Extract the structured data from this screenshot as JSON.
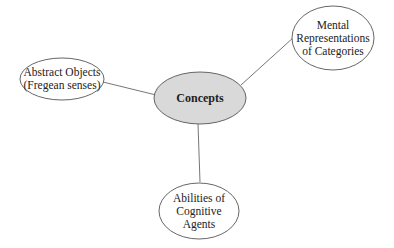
{
  "colors": {
    "stroke": "#555555",
    "center_fill": "#d9d9d9",
    "node_fill": "#ffffff",
    "text": "#222222"
  },
  "diagram": {
    "type": "mind-map",
    "center": {
      "label": "Concepts"
    },
    "nodes": [
      {
        "id": "abstract",
        "lines": [
          "Abstract Objects",
          "(Fregean senses)"
        ]
      },
      {
        "id": "mental",
        "lines": [
          "Mental",
          "Representations",
          "of Categories"
        ]
      },
      {
        "id": "abilities",
        "lines": [
          "Abilities of",
          "Cognitive Agents"
        ]
      }
    ],
    "edges": [
      {
        "from": "Concepts",
        "to": "abstract"
      },
      {
        "from": "Concepts",
        "to": "mental"
      },
      {
        "from": "Concepts",
        "to": "abilities"
      }
    ]
  }
}
